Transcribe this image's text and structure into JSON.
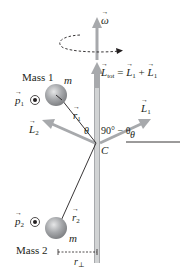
{
  "diagram": {
    "labels": {
      "omega": "ω",
      "L_tot_symbol": "L",
      "L_tot_sub": "tot",
      "L_tot_eq": " = ",
      "L_tot_rhs1": "L",
      "L_tot_rhs1_sub": "1",
      "L_tot_plus": " + ",
      "L_tot_rhs2": "L",
      "L_tot_rhs2_sub": "1",
      "mass1": "Mass 1",
      "mass1_m": "m",
      "mass2": "Mass 2",
      "mass2_m": "m",
      "p1": "p",
      "p1_sub": "1",
      "p2": "p",
      "p2_sub": "2",
      "r1": "r",
      "r1_sub": "1",
      "r2": "r",
      "r2_sub": "2",
      "L1": "L",
      "L1_sub": "1",
      "L2": "L",
      "L2_sub": "2",
      "theta_left": "θ",
      "angle_complement": "90° − θ",
      "theta_right": "θ",
      "center": "C",
      "r_perp": "r",
      "r_perp_sub": "⊥"
    },
    "colors": {
      "arrow_gray": "#a7a9ac",
      "rod_gray": "#bcbec0",
      "ball_gray": "#9d9fa2",
      "ink": "#231f20"
    }
  }
}
